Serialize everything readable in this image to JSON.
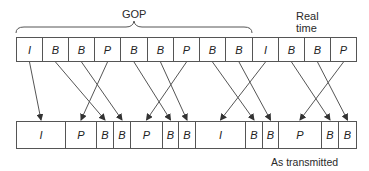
{
  "labels": {
    "gop": "GOP",
    "real_time_line1": "Real",
    "real_time_line2": "time",
    "as_transmitted": "As transmitted"
  },
  "top_row": {
    "title": "Real time",
    "frames": [
      "I",
      "B",
      "B",
      "P",
      "B",
      "B",
      "P",
      "B",
      "B",
      "I",
      "B",
      "B",
      "P"
    ]
  },
  "bottom_row": {
    "title": "As transmitted",
    "frames": [
      "I",
      "P",
      "B",
      "B",
      "P",
      "B",
      "B",
      "I",
      "B",
      "B",
      "P",
      "B",
      "B"
    ]
  },
  "mapping": [
    {
      "from": 0,
      "to": 0
    },
    {
      "from": 1,
      "to": 2
    },
    {
      "from": 2,
      "to": 3
    },
    {
      "from": 3,
      "to": 1
    },
    {
      "from": 4,
      "to": 5
    },
    {
      "from": 5,
      "to": 6
    },
    {
      "from": 6,
      "to": 4
    },
    {
      "from": 7,
      "to": 8
    },
    {
      "from": 8,
      "to": 9
    },
    {
      "from": 9,
      "to": 7
    },
    {
      "from": 10,
      "to": 11
    },
    {
      "from": 11,
      "to": 12
    },
    {
      "from": 12,
      "to": 10
    }
  ],
  "colors": {
    "line": "#555555",
    "text": "#222222"
  }
}
